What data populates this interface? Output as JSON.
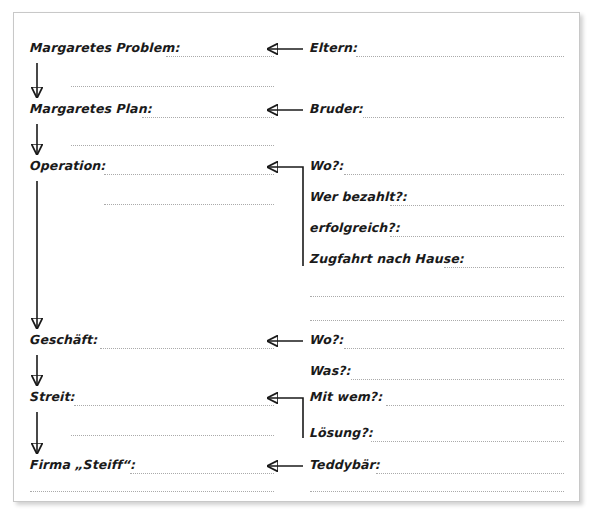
{
  "worksheet": {
    "title": "Margaretes Geschichte - Flussdiagramm Arbeitsblatt",
    "left_column": {
      "items": [
        {
          "label": "Margaretes Problem:"
        },
        {
          "label": "Margaretes Plan:"
        },
        {
          "label": "Operation:"
        },
        {
          "label": "Geschäft:"
        },
        {
          "label": "Streit:"
        },
        {
          "label": "Firma „Steiff“:"
        }
      ]
    },
    "right_column": {
      "items": [
        {
          "label": "Eltern:"
        },
        {
          "label": "Bruder:"
        },
        {
          "label": "Wo?:"
        },
        {
          "label": "Wer bezahlt?:"
        },
        {
          "label": "erfolgreich?:"
        },
        {
          "label": "Zugfahrt nach Hause:"
        },
        {
          "label": "Wo?:"
        },
        {
          "label": "Was?:"
        },
        {
          "label": "Mit wem?:"
        },
        {
          "label": "Lösung?:"
        },
        {
          "label": "Teddybär:"
        }
      ]
    },
    "colors": {
      "ink": "#1a1a1a",
      "dotted_rule": "#aaaaaa",
      "frame_border": "#c8c8c8",
      "paper": "#ffffff"
    }
  }
}
